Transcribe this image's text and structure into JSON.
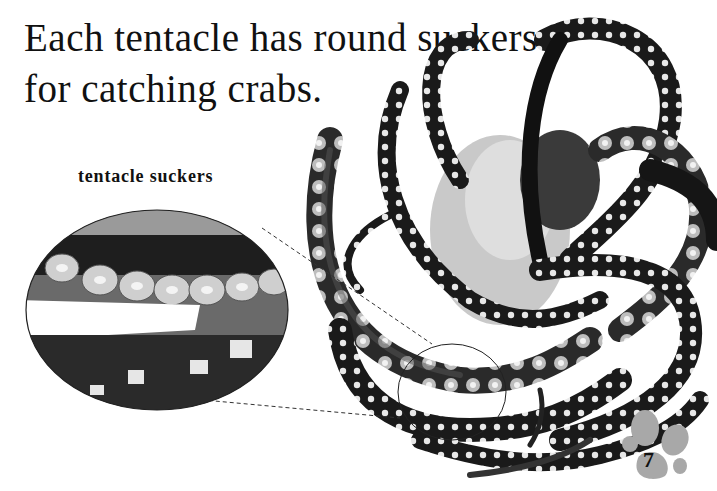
{
  "page": {
    "heading_lines": [
      "Each tentacle has round suckers",
      "for catching crabs."
    ],
    "inset_caption": "tentacle suckers",
    "page_number": "7",
    "images": {
      "main_photo": "octopus with curling tentacles, black and white photo",
      "inset_photo": "close-up of tentacle suckers in oval magnifier"
    },
    "colors": {
      "text": "#111111",
      "paw_print": "#a8a8a8",
      "background": "#ffffff"
    }
  }
}
